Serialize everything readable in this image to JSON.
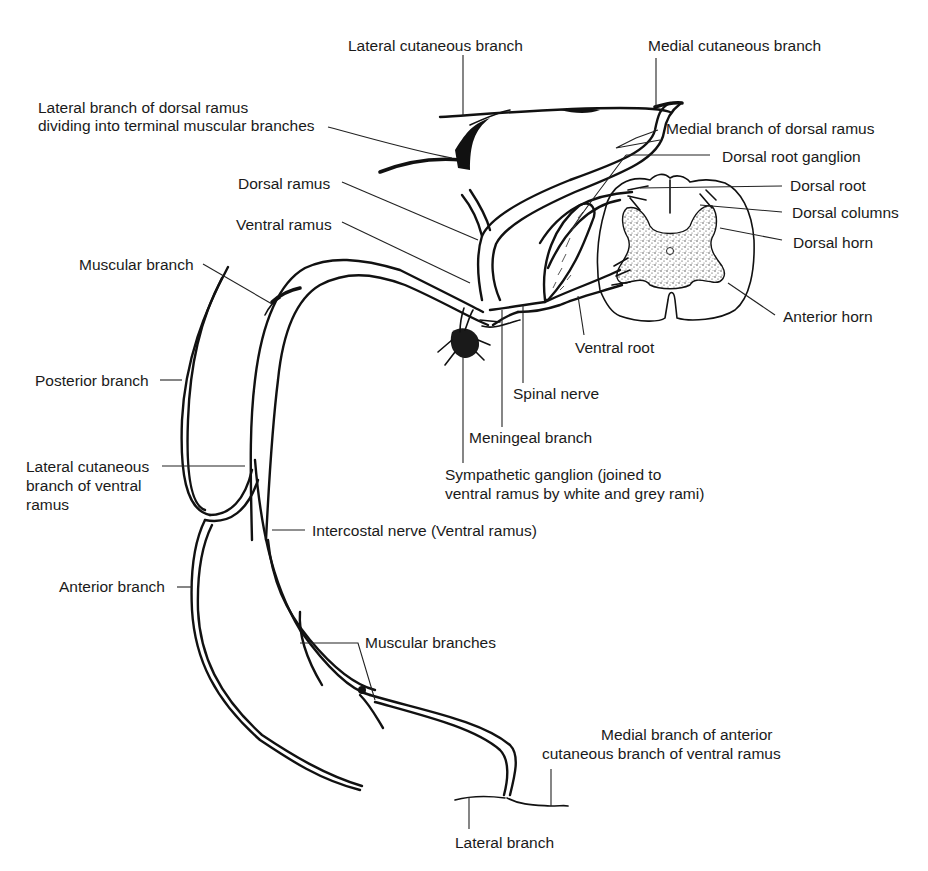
{
  "diagram": {
    "stroke_color": "#111111",
    "background_color": "#ffffff"
  },
  "labels": {
    "lateral_cutaneous_branch": "Lateral cutaneous branch",
    "medial_cutaneous_branch": "Medial cutaneous branch",
    "lateral_branch_dorsal_ramus_line1": "Lateral branch of dorsal ramus",
    "lateral_branch_dorsal_ramus_line2": "dividing into terminal muscular branches",
    "medial_branch_dorsal_ramus": "Medial branch of dorsal ramus",
    "dorsal_root_ganglion": "Dorsal root ganglion",
    "dorsal_ramus": "Dorsal ramus",
    "dorsal_root": "Dorsal root",
    "dorsal_columns": "Dorsal columns",
    "ventral_ramus": "Ventral ramus",
    "dorsal_horn": "Dorsal horn",
    "muscular_branch": "Muscular branch",
    "anterior_horn": "Anterior horn",
    "ventral_root": "Ventral root",
    "posterior_branch": "Posterior branch",
    "spinal_nerve": "Spinal nerve",
    "meningeal_branch": "Meningeal branch",
    "sympathetic_ganglion_line1": "Sympathetic ganglion (joined to",
    "sympathetic_ganglion_line2": "ventral ramus by white and grey rami)",
    "lateral_cutaneous_ventral_line1": "Lateral cutaneous",
    "lateral_cutaneous_ventral_line2": "branch of ventral",
    "lateral_cutaneous_ventral_line3": "ramus",
    "intercostal_nerve": "Intercostal nerve (Ventral ramus)",
    "anterior_branch": "Anterior branch",
    "muscular_branches": "Muscular branches",
    "medial_branch_anterior_line1": "Medial branch of anterior",
    "medial_branch_anterior_line2": "cutaneous branch of ventral ramus",
    "lateral_branch": "Lateral branch"
  }
}
